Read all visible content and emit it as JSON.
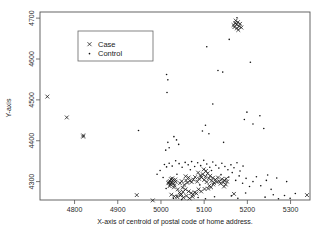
{
  "chart_data": {
    "type": "scatter",
    "title": "",
    "xlabel": "X-axis of centroid of postal code of home address.",
    "ylabel": "Y-axis",
    "xlim": [
      4720,
      5345
    ],
    "ylim": [
      4255,
      4715
    ],
    "xticks": [
      4800,
      4900,
      5000,
      5100,
      5200,
      5300
    ],
    "yticks": [
      4300,
      4400,
      4500,
      4600,
      4700
    ],
    "grid": false,
    "legend_position": "upper-left",
    "series": [
      {
        "name": "Case",
        "marker": "x",
        "color": "#111111",
        "points": [
          [
            4737,
            4508
          ],
          [
            4782,
            4457
          ],
          [
            4820,
            4413
          ],
          [
            4820,
            4410
          ],
          [
            4944,
            4267
          ],
          [
            4981,
            4254
          ],
          [
            5018,
            4299
          ],
          [
            5021,
            4301
          ],
          [
            5024,
            4297
          ],
          [
            5027,
            4303
          ],
          [
            5022,
            4293
          ],
          [
            5029,
            4296
          ],
          [
            5026,
            4308
          ],
          [
            5031,
            4291
          ],
          [
            5034,
            4300
          ],
          [
            5020,
            4289
          ],
          [
            5023,
            4306
          ],
          [
            5030,
            4286
          ],
          [
            5017,
            4296
          ],
          [
            5033,
            4305
          ],
          [
            5039,
            4281
          ],
          [
            5043,
            4273
          ],
          [
            5047,
            4269
          ],
          [
            5051,
            4275
          ],
          [
            5044,
            4296
          ],
          [
            5048,
            4301
          ],
          [
            5054,
            4292
          ],
          [
            5058,
            4303
          ],
          [
            5061,
            4297
          ],
          [
            5064,
            4310
          ],
          [
            5057,
            4313
          ],
          [
            5067,
            4302
          ],
          [
            5070,
            4272
          ],
          [
            5074,
            4268
          ],
          [
            5078,
            4274
          ],
          [
            5082,
            4271
          ],
          [
            5071,
            4299
          ],
          [
            5075,
            4305
          ],
          [
            5079,
            4311
          ],
          [
            5084,
            4300
          ],
          [
            5088,
            4307
          ],
          [
            5091,
            4315
          ],
          [
            5086,
            4322
          ],
          [
            5094,
            4310
          ],
          [
            5097,
            4318
          ],
          [
            5100,
            4304
          ],
          [
            5103,
            4312
          ],
          [
            5106,
            4299
          ],
          [
            5099,
            4330
          ],
          [
            5104,
            4326
          ],
          [
            5108,
            4320
          ],
          [
            5111,
            4308
          ],
          [
            5114,
            4314
          ],
          [
            5117,
            4302
          ],
          [
            5120,
            4309
          ],
          [
            5123,
            4297
          ],
          [
            5112,
            4290
          ],
          [
            5116,
            4286
          ],
          [
            5109,
            4283
          ],
          [
            5121,
            4293
          ],
          [
            5126,
            4305
          ],
          [
            5129,
            4299
          ],
          [
            5132,
            4310
          ],
          [
            5135,
            4301
          ],
          [
            5138,
            4295
          ],
          [
            5141,
            4306
          ],
          [
            5144,
            4298
          ],
          [
            5147,
            4303
          ],
          [
            5150,
            4293
          ],
          [
            5153,
            4300
          ],
          [
            5146,
            4288
          ],
          [
            5151,
            4307
          ],
          [
            5024,
            4268
          ],
          [
            5031,
            4264
          ],
          [
            5038,
            4262
          ],
          [
            5045,
            4266
          ],
          [
            5052,
            4261
          ],
          [
            5059,
            4265
          ],
          [
            5066,
            4259
          ],
          [
            5073,
            4263
          ],
          [
            5093,
            4276
          ],
          [
            5087,
            4281
          ],
          [
            5101,
            4282
          ],
          [
            5064,
            4276
          ],
          [
            5057,
            4281
          ],
          [
            5050,
            4285
          ],
          [
            5169,
            4270
          ],
          [
            5172,
            4688
          ],
          [
            5175,
            4684
          ],
          [
            5178,
            4690
          ],
          [
            5181,
            4680
          ],
          [
            5170,
            4678
          ],
          [
            5176,
            4675
          ],
          [
            5183,
            4686
          ],
          [
            5179,
            4671
          ],
          [
            5173,
            4694
          ],
          [
            5186,
            4677
          ],
          [
            5168,
            4683
          ],
          [
            5338,
            4267
          ]
        ]
      },
      {
        "name": "Control",
        "marker": ".",
        "color": "#111111",
        "points": [
          [
            5013,
            4562
          ],
          [
            5016,
            4549
          ],
          [
            5014,
            4518
          ],
          [
            5106,
            4630
          ],
          [
            5143,
            4568
          ],
          [
            5176,
            4701
          ],
          [
            5158,
            4648
          ],
          [
            5207,
            4592
          ],
          [
            5132,
            4572
          ],
          [
            4948,
            4425
          ],
          [
            5016,
            4396
          ],
          [
            5019,
            4383
          ],
          [
            5011,
            4377
          ],
          [
            5030,
            4410
          ],
          [
            5036,
            4402
          ],
          [
            5041,
            4391
          ],
          [
            5103,
            4438
          ],
          [
            5111,
            4417
          ],
          [
            5096,
            4424
          ],
          [
            5145,
            4396
          ],
          [
            5193,
            4452
          ],
          [
            5213,
            4441
          ],
          [
            5229,
            4461
          ],
          [
            5199,
            4470
          ],
          [
            5120,
            4490
          ],
          [
            5238,
            4430
          ],
          [
            5008,
            4342
          ],
          [
            5013,
            4336
          ],
          [
            5019,
            4345
          ],
          [
            5026,
            4338
          ],
          [
            5034,
            4351
          ],
          [
            5042,
            4344
          ],
          [
            5049,
            4335
          ],
          [
            5056,
            4347
          ],
          [
            5063,
            4341
          ],
          [
            5071,
            4349
          ],
          [
            5078,
            4337
          ],
          [
            5085,
            4346
          ],
          [
            5092,
            4339
          ],
          [
            5099,
            4352
          ],
          [
            5106,
            4343
          ],
          [
            5113,
            4335
          ],
          [
            5120,
            4348
          ],
          [
            5127,
            4340
          ],
          [
            5134,
            4333
          ],
          [
            5141,
            4345
          ],
          [
            5148,
            4337
          ],
          [
            5155,
            4329
          ],
          [
            5162,
            4341
          ],
          [
            5169,
            4334
          ],
          [
            5176,
            4346
          ],
          [
            5183,
            4326
          ],
          [
            5190,
            4338
          ],
          [
            5005,
            4310
          ],
          [
            5012,
            4283
          ],
          [
            5037,
            4318
          ],
          [
            5068,
            4329
          ],
          [
            5090,
            4292
          ],
          [
            5117,
            4327
          ],
          [
            5139,
            4317
          ],
          [
            5157,
            4311
          ],
          [
            5165,
            4322
          ],
          [
            5173,
            4303
          ],
          [
            5181,
            4314
          ],
          [
            5189,
            4296
          ],
          [
            5197,
            4308
          ],
          [
            5205,
            4288
          ],
          [
            5213,
            4300
          ],
          [
            5221,
            4312
          ],
          [
            5231,
            4290
          ],
          [
            5244,
            4303
          ],
          [
            5255,
            4281
          ],
          [
            5163,
            4265
          ],
          [
            5178,
            4259
          ],
          [
            5196,
            4272
          ],
          [
            5241,
            4262
          ],
          [
            5260,
            4268
          ],
          [
            5272,
            4258
          ],
          [
            5286,
            4266
          ],
          [
            5299,
            4259
          ],
          [
            5311,
            4271
          ],
          [
            5247,
            4316
          ],
          [
            5268,
            4309
          ],
          [
            5291,
            4300
          ],
          [
            5037,
            4265
          ],
          [
            5029,
            4259
          ],
          [
            5048,
            4256
          ],
          [
            5086,
            4261
          ],
          [
            5103,
            4258
          ],
          [
            5124,
            4263
          ],
          [
            4991,
            4318
          ],
          [
            4998,
            4327
          ]
        ]
      }
    ]
  },
  "legend": {
    "entries": [
      {
        "label": "Case",
        "glyph": "x-marker"
      },
      {
        "label": "Control",
        "glyph": "dot-marker"
      }
    ]
  },
  "axes": {
    "x_title": "X-axis of centroid of postal code of home address.",
    "y_title": "Y-axis",
    "x_tick_labels": [
      "4800",
      "4900",
      "5000",
      "5100",
      "5200",
      "5300"
    ],
    "y_tick_labels": [
      "4300",
      "4400",
      "4500",
      "4600",
      "4700"
    ]
  },
  "colors": {
    "marker": "#111111",
    "frame": "#555555",
    "background": "#ffffff"
  }
}
